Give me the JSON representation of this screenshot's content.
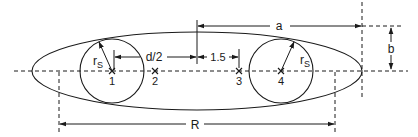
{
  "figure": {
    "labels": {
      "a": "a",
      "b": "b",
      "R": "R",
      "half_d": "d/2",
      "spacing": "1.5",
      "radius_left": "r",
      "radius_left_sub": "S",
      "radius_right": "r",
      "radius_right_sub": "S"
    },
    "points": [
      {
        "id": "1",
        "label": "1"
      },
      {
        "id": "2",
        "label": "2"
      },
      {
        "id": "3",
        "label": "3"
      },
      {
        "id": "4",
        "label": "4"
      }
    ],
    "colors": {
      "ink": "#1a1a1a",
      "background": "#ffffff"
    }
  }
}
